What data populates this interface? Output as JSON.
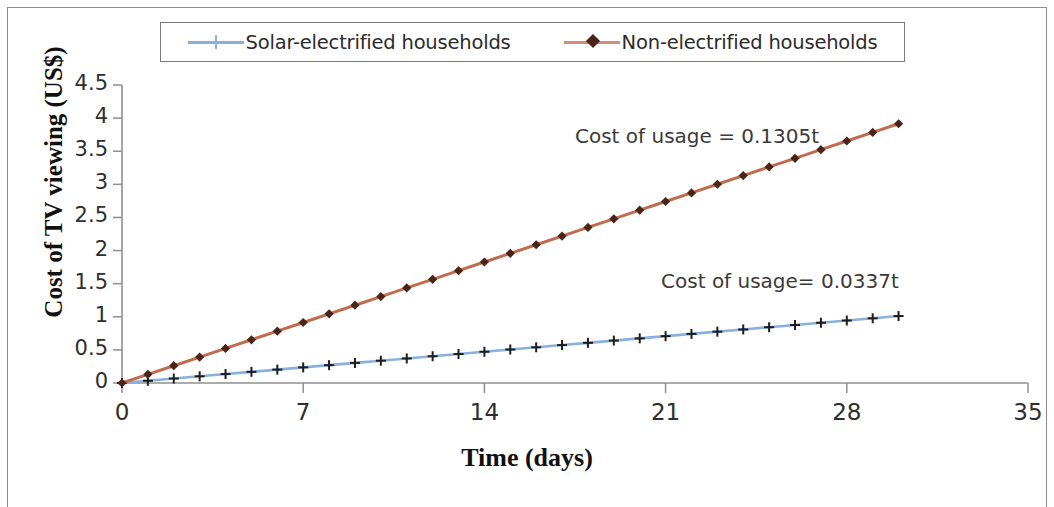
{
  "legend": {
    "entries": [
      {
        "label": "Solar-electrified households",
        "marker": "plus-marker-icon",
        "line_color": "#8ab0e0",
        "marker_color": "#8ab0e0"
      },
      {
        "label": "Non-electrified households",
        "marker": "diamond-marker-icon",
        "line_color": "#d98b76",
        "marker_color": "#4a2418"
      }
    ]
  },
  "annotations": [
    {
      "text": "Cost of usage = 0.1305t",
      "x": 0.5,
      "y": 3.72
    },
    {
      "text": "Cost of usage= 0.0337t",
      "x": 0.595,
      "y": 1.52
    }
  ],
  "chart_data": {
    "type": "line",
    "title": "",
    "xlabel": "Time (days)",
    "ylabel": "Cost of TV viewing (US$)",
    "xlim": [
      0,
      35
    ],
    "ylim": [
      0,
      4.5
    ],
    "xticks": [
      "0",
      "7",
      "14",
      "21",
      "28",
      "35"
    ],
    "xtick_values": [
      0,
      7,
      14,
      21,
      28,
      35
    ],
    "yticks": [
      "0",
      "0.5",
      "1",
      "1.5",
      "2",
      "2.5",
      "3",
      "3.5",
      "4",
      "4.5"
    ],
    "ytick_values": [
      0,
      0.5,
      1,
      1.5,
      2,
      2.5,
      3,
      3.5,
      4,
      4.5
    ],
    "grid": false,
    "legend_position": "top",
    "x": [
      0,
      1,
      2,
      3,
      4,
      5,
      6,
      7,
      8,
      9,
      10,
      11,
      12,
      13,
      14,
      15,
      16,
      17,
      18,
      19,
      20,
      21,
      22,
      23,
      24,
      25,
      26,
      27,
      28,
      29,
      30
    ],
    "series": [
      {
        "name": "Solar-electrified households",
        "color": "#8ab0e0",
        "marker_color": "#1d1d1d",
        "slope": 0.0337,
        "equation": "Cost of usage= 0.0337t",
        "values": [
          0,
          0.0337,
          0.0674,
          0.1011,
          0.1348,
          0.1685,
          0.2022,
          0.2359,
          0.2696,
          0.3033,
          0.337,
          0.3707,
          0.4044,
          0.4381,
          0.4718,
          0.5055,
          0.5392,
          0.5729,
          0.6066,
          0.6403,
          0.674,
          0.7077,
          0.7414,
          0.7751,
          0.8088,
          0.8425,
          0.8762,
          0.9099,
          0.9436,
          0.9773,
          1.011
        ]
      },
      {
        "name": "Non-electrified households",
        "color": "#c06a50",
        "marker_color": "#4a2418",
        "slope": 0.1305,
        "equation": "Cost of usage = 0.1305t",
        "values": [
          0,
          0.1305,
          0.261,
          0.3915,
          0.522,
          0.6525,
          0.783,
          0.9135,
          1.044,
          1.1745,
          1.305,
          1.4355,
          1.566,
          1.6965,
          1.827,
          1.9575,
          2.088,
          2.2185,
          2.349,
          2.4795,
          2.61,
          2.7405,
          2.871,
          3.0015,
          3.132,
          3.2625,
          3.393,
          3.5235,
          3.654,
          3.7845,
          3.915
        ]
      }
    ]
  },
  "colors": {
    "axis": "#8f8f8f",
    "frame": "#8c8c8c",
    "text": "#2b2b2b"
  }
}
